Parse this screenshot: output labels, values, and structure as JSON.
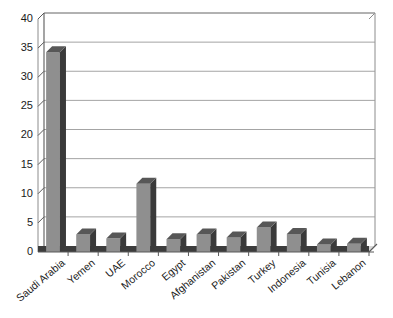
{
  "chart_data": {
    "type": "bar",
    "title": "",
    "subtitle": "",
    "xlabel": "",
    "ylabel": "",
    "categories": [
      "Saudi Arabia",
      "Yemen",
      "UAE",
      "Morocco",
      "Egypt",
      "Afghanistan",
      "Pakistan",
      "Turkey",
      "Indonesia",
      "Tunisia",
      "Lebanon"
    ],
    "values": [
      34.3,
      3.0,
      2.3,
      11.7,
      2.2,
      3.0,
      2.5,
      4.2,
      3.1,
      1.3,
      1.4
    ],
    "series": [
      {
        "name": "",
        "values": [
          34.3,
          3.0,
          2.3,
          11.7,
          2.2,
          3.0,
          2.5,
          4.2,
          3.1,
          1.3,
          1.4
        ]
      }
    ],
    "ylim": [
      0,
      40
    ],
    "ytick_labels": [
      "0",
      "5",
      "10",
      "15",
      "20",
      "25",
      "30",
      "35",
      "40"
    ],
    "ytick_values": [
      0,
      5,
      10,
      15,
      20,
      25,
      30,
      35,
      40
    ],
    "grid": true,
    "grid_axis": "y",
    "legend": false,
    "legend_position": "none",
    "style": "3d-column",
    "colors": {
      "bar_front": "#8f8f8f",
      "bar_side": "#3a3a3a",
      "bar_top": "#575757",
      "gridline": "#9a9a9a",
      "axis": "#5a5a5a",
      "plot_background": "#ffffff",
      "text": "#1a1a1a"
    },
    "xtick_label_rotation": -40
  }
}
